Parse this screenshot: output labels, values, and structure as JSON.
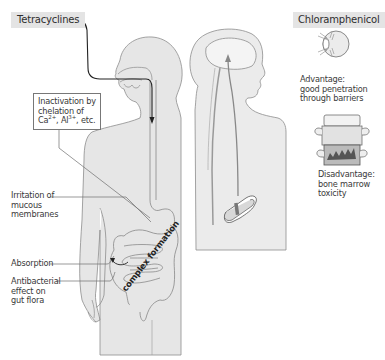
{
  "diagram": {
    "title_left": "Tetracyclines",
    "title_right": "Chloramphenicol",
    "colors": {
      "body_fill": "#e6e6e6",
      "outline": "#8a8a8a",
      "path_line": "#222222",
      "tag_bg": "#e4e4e4",
      "brain_fill": "#efefef"
    },
    "tetracyclines": {
      "inactivation_box": {
        "line1": "Inactivation by",
        "line2": "chelation of",
        "ion1": "Ca",
        "ion1_charge": "2+",
        "ion2": "Al",
        "ion2_charge": "3+",
        "suffix": ", etc."
      },
      "labels": [
        {
          "id": "irritation",
          "lines": [
            "Irritation of",
            "mucous",
            "membranes"
          ]
        },
        {
          "id": "absorption",
          "lines": [
            "Absorption"
          ]
        },
        {
          "id": "antibacterial",
          "lines": [
            "Antibacterial",
            "effect on",
            "gut flora"
          ]
        }
      ],
      "intestine_text": "complex formation"
    },
    "chloramphenicol": {
      "advantage": {
        "lines": [
          "Advantage:",
          "good penetration",
          "through barriers"
        ],
        "icon": "eye-icon"
      },
      "disadvantage": {
        "lines": [
          "Disadvantage:",
          "bone marrow",
          "toxicity"
        ],
        "icon": "vertebra-bone-marrow-icon"
      },
      "tablet_icon": "tablet-icon"
    }
  }
}
